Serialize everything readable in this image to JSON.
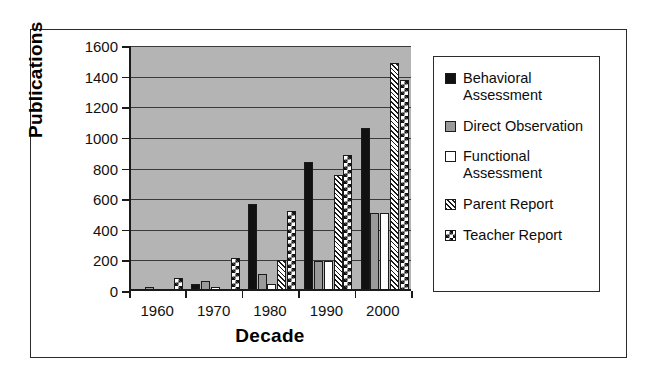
{
  "chart_data": {
    "type": "bar",
    "title": "",
    "xlabel": "Decade",
    "ylabel": "Publications",
    "categories": [
      "1960",
      "1970",
      "1980",
      "1990",
      "2000"
    ],
    "ylim": [
      0,
      1600
    ],
    "ytick_step": 200,
    "yticks": [
      "1600",
      "1400",
      "1200",
      "1000",
      "800",
      "600",
      "400",
      "200",
      "0"
    ],
    "grid": true,
    "legend_position": "right",
    "series": [
      {
        "name": "Behavioral Assessment",
        "pattern": "solid-black",
        "values": [
          5,
          45,
          565,
          845,
          1065
        ]
      },
      {
        "name": "Direct Observation",
        "pattern": "solid-grey",
        "values": [
          25,
          65,
          110,
          195,
          510
        ]
      },
      {
        "name": "Functional Assessment",
        "pattern": "solid-white",
        "values": [
          0,
          25,
          45,
          195,
          510
        ]
      },
      {
        "name": "Parent Report",
        "pattern": "diagonal-hatch",
        "values": [
          0,
          15,
          205,
          755,
          1490
        ]
      },
      {
        "name": "Teacher Report",
        "pattern": "checkerboard",
        "values": [
          85,
          215,
          525,
          890,
          1375
        ]
      }
    ]
  },
  "legend": {
    "items": [
      {
        "label": "Behavioral Assessment"
      },
      {
        "label": "Direct Observation"
      },
      {
        "label": "Functional Assessment"
      },
      {
        "label": "Parent Report"
      },
      {
        "label": "Teacher Report"
      }
    ]
  }
}
